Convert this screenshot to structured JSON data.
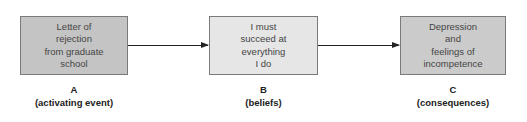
{
  "diagram": {
    "type": "flow",
    "nodes": [
      {
        "id": "A",
        "lines": [
          "Letter of",
          "rejection",
          "from graduate",
          "school"
        ],
        "letter": "A",
        "caption": "(activating event)",
        "fill": "#c4c4c4"
      },
      {
        "id": "B",
        "lines": [
          "I must",
          "succeed at",
          "everything",
          "I do"
        ],
        "letter": "B",
        "caption": "(beliefs)",
        "fill": "#e6e6e6"
      },
      {
        "id": "C",
        "lines": [
          "Depression",
          "and",
          "feelings of",
          "incompetence"
        ],
        "letter": "C",
        "caption": "(consequences)",
        "fill": "#cbcbcb"
      }
    ],
    "edges": [
      {
        "from": "A",
        "to": "B"
      },
      {
        "from": "B",
        "to": "C"
      }
    ]
  }
}
